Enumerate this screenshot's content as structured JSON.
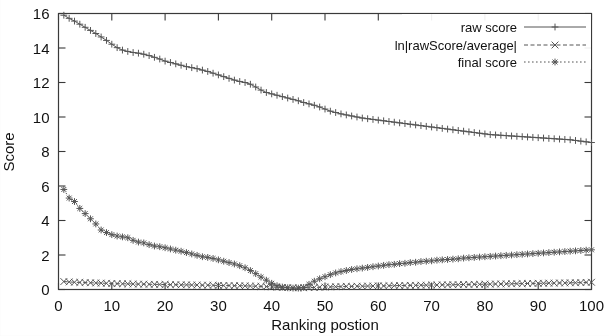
{
  "chart_data": {
    "type": "line",
    "title": "",
    "xlabel": "Ranking postion",
    "ylabel": "Score",
    "xlim": [
      0,
      100
    ],
    "ylim": [
      0,
      16
    ],
    "xticks": [
      0,
      10,
      20,
      30,
      40,
      50,
      60,
      70,
      80,
      90,
      100
    ],
    "yticks": [
      0,
      2,
      4,
      6,
      8,
      10,
      12,
      14,
      16
    ],
    "grid": false,
    "legend_position": "top-right",
    "x": [
      1,
      2,
      3,
      4,
      5,
      6,
      7,
      8,
      9,
      10,
      11,
      12,
      13,
      14,
      15,
      16,
      17,
      18,
      19,
      20,
      21,
      22,
      23,
      24,
      25,
      26,
      27,
      28,
      29,
      30,
      31,
      32,
      33,
      34,
      35,
      36,
      37,
      38,
      39,
      40,
      41,
      42,
      43,
      44,
      45,
      46,
      47,
      48,
      49,
      50,
      51,
      52,
      53,
      54,
      55,
      56,
      57,
      58,
      59,
      60,
      61,
      62,
      63,
      64,
      65,
      66,
      67,
      68,
      69,
      70,
      71,
      72,
      73,
      74,
      75,
      76,
      77,
      78,
      79,
      80,
      81,
      82,
      83,
      84,
      85,
      86,
      87,
      88,
      89,
      90,
      91,
      92,
      93,
      94,
      95,
      96,
      97,
      98,
      99,
      100
    ],
    "series": [
      {
        "name": "raw score",
        "marker": "+",
        "dash": "solid",
        "values": [
          15.9,
          15.72,
          15.56,
          15.38,
          15.2,
          15.02,
          14.84,
          14.64,
          14.44,
          14.22,
          14.02,
          13.88,
          13.8,
          13.74,
          13.7,
          13.64,
          13.56,
          13.46,
          13.36,
          13.24,
          13.16,
          13.08,
          13.0,
          12.92,
          12.86,
          12.8,
          12.72,
          12.64,
          12.54,
          12.44,
          12.34,
          12.24,
          12.14,
          12.06,
          12.0,
          11.9,
          11.74,
          11.56,
          11.42,
          11.34,
          11.26,
          11.18,
          11.1,
          11.02,
          10.94,
          10.84,
          10.76,
          10.68,
          10.58,
          10.46,
          10.34,
          10.26,
          10.18,
          10.12,
          10.06,
          10.0,
          9.94,
          9.9,
          9.86,
          9.82,
          9.78,
          9.74,
          9.7,
          9.66,
          9.62,
          9.58,
          9.54,
          9.5,
          9.46,
          9.42,
          9.38,
          9.34,
          9.3,
          9.26,
          9.22,
          9.18,
          9.14,
          9.1,
          9.06,
          9.02,
          8.98,
          8.96,
          8.94,
          8.92,
          8.9,
          8.88,
          8.86,
          8.84,
          8.82,
          8.8,
          8.78,
          8.76,
          8.74,
          8.72,
          8.7,
          8.68,
          8.64,
          8.6,
          8.56,
          8.52
        ]
      },
      {
        "name": "ln|rawScore/average|",
        "marker": "x",
        "dash": "dashed",
        "values": [
          0.46,
          0.44,
          0.42,
          0.41,
          0.4,
          0.39,
          0.38,
          0.37,
          0.36,
          0.35,
          0.34,
          0.33,
          0.33,
          0.32,
          0.31,
          0.31,
          0.3,
          0.3,
          0.29,
          0.29,
          0.28,
          0.28,
          0.27,
          0.27,
          0.26,
          0.26,
          0.25,
          0.25,
          0.24,
          0.24,
          0.23,
          0.23,
          0.22,
          0.22,
          0.21,
          0.2,
          0.19,
          0.18,
          0.17,
          0.15,
          0.13,
          0.12,
          0.11,
          0.1,
          0.1,
          0.1,
          0.11,
          0.12,
          0.13,
          0.14,
          0.15,
          0.16,
          0.17,
          0.18,
          0.18,
          0.19,
          0.19,
          0.2,
          0.2,
          0.21,
          0.21,
          0.22,
          0.22,
          0.23,
          0.23,
          0.24,
          0.24,
          0.25,
          0.25,
          0.26,
          0.26,
          0.27,
          0.27,
          0.28,
          0.28,
          0.29,
          0.29,
          0.3,
          0.3,
          0.31,
          0.31,
          0.32,
          0.32,
          0.33,
          0.33,
          0.34,
          0.34,
          0.35,
          0.35,
          0.36,
          0.36,
          0.37,
          0.37,
          0.38,
          0.38,
          0.39,
          0.39,
          0.4,
          0.41,
          0.42
        ]
      },
      {
        "name": "final score",
        "marker": "*",
        "dash": "dotted",
        "values": [
          5.8,
          5.3,
          5.1,
          4.7,
          4.4,
          4.1,
          3.8,
          3.45,
          3.3,
          3.18,
          3.1,
          3.05,
          3.0,
          2.85,
          2.75,
          2.7,
          2.6,
          2.52,
          2.48,
          2.42,
          2.35,
          2.28,
          2.22,
          2.14,
          2.06,
          1.98,
          1.9,
          1.86,
          1.8,
          1.72,
          1.64,
          1.56,
          1.48,
          1.38,
          1.26,
          1.1,
          0.92,
          0.72,
          0.54,
          0.36,
          0.22,
          0.14,
          0.1,
          0.08,
          0.08,
          0.12,
          0.3,
          0.48,
          0.62,
          0.74,
          0.86,
          0.96,
          1.04,
          1.1,
          1.16,
          1.2,
          1.24,
          1.28,
          1.32,
          1.36,
          1.4,
          1.44,
          1.46,
          1.5,
          1.52,
          1.56,
          1.58,
          1.62,
          1.64,
          1.66,
          1.7,
          1.72,
          1.74,
          1.76,
          1.78,
          1.82,
          1.84,
          1.86,
          1.88,
          1.9,
          1.92,
          1.94,
          1.96,
          1.98,
          2.0,
          2.02,
          2.04,
          2.06,
          2.08,
          2.1,
          2.12,
          2.14,
          2.16,
          2.18,
          2.2,
          2.22,
          2.24,
          2.26,
          2.28,
          2.3
        ]
      }
    ]
  },
  "legend": {
    "items": [
      {
        "label": "raw score"
      },
      {
        "label": "ln|rawScore/average|"
      },
      {
        "label": "final score"
      }
    ]
  },
  "axes": {
    "y_title": "Score",
    "x_title": "Ranking postion"
  },
  "colors": {
    "ink": "#1a1a1a",
    "line": "#555555",
    "frame": "#3a3a3a"
  }
}
